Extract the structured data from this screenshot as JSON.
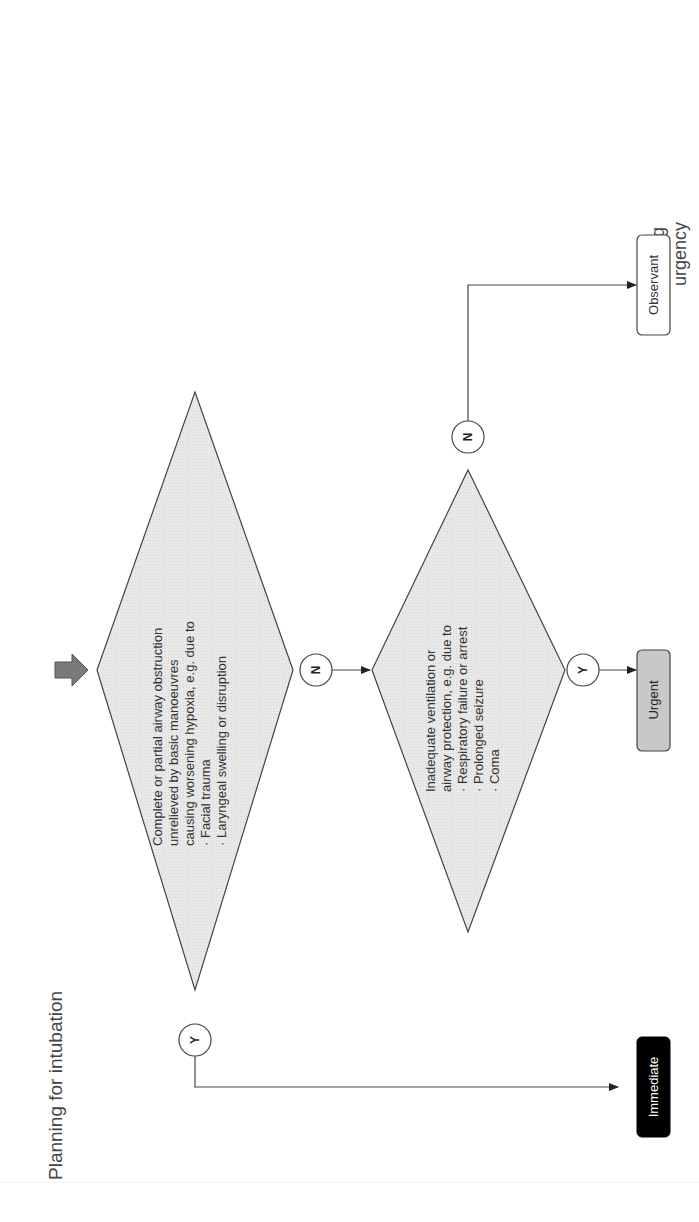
{
  "title": "Planning for intubation",
  "subtitle": "Assessing urgency",
  "subtitle_lines": [
    "Assessing",
    "urgency"
  ],
  "colors": {
    "diamond_fill": "#e6e6e6",
    "stroke": "#444444",
    "urgent_fill": "#c8c8c8",
    "immediate_fill": "#000000",
    "observant_fill": "#ffffff",
    "entry_arrow_fill": "#777777"
  },
  "decisions": [
    {
      "id": "airway-obstruction",
      "lines": [
        "Complete or partial airway obstruction",
        "unrelieved by basic manoeuvres",
        "causing worsening hypoxia, e.g. due to",
        "· Facial trauma",
        "· Laryngeal swelling or disruption"
      ],
      "yes": "Y",
      "no": "N"
    },
    {
      "id": "inadequate-ventilation",
      "lines": [
        "Inadequate ventilation or",
        "airway protection, e.g. due to",
        "· Respiratory failure or arrest",
        "· Prolonged seizure",
        "· Coma"
      ],
      "yes": "Y",
      "no": "N"
    }
  ],
  "outcomes": {
    "immediate": "Immediate",
    "urgent": "Urgent",
    "observant": "Observant"
  }
}
